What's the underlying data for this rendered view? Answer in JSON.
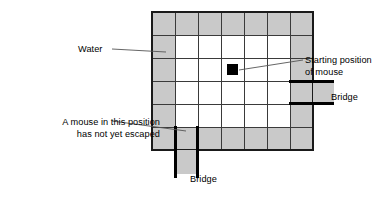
{
  "diagram": {
    "type": "grid-maze",
    "grid": {
      "rows": 7,
      "cols": 7,
      "cell_size_px": 23,
      "origin_x_px": 152,
      "origin_y_px": 12,
      "water_color": "#c9c9c9",
      "land_color": "#ffffff",
      "line_color": "#3a3a3a",
      "outer_line_color": "#1a1a1a",
      "bridge_color": "#000000",
      "mouse_color": "#000000",
      "water_ring_cells": "all perimeter cells of the 7x7 grid",
      "interior_cells": "5x5 white block, rows 2-6, cols 2-6",
      "mouse_start_cell": {
        "row": 3,
        "col": 4
      }
    },
    "bridges": [
      {
        "id": "bridge-right",
        "position": "right edge, row 4",
        "orientation": "horizontal",
        "extends_px": 36
      },
      {
        "id": "bridge-bottom",
        "position": "bottom edge, col 2",
        "orientation": "vertical",
        "extends_px": 28
      }
    ]
  },
  "labels": {
    "water": "Water",
    "starting_position_line1": "Starting position",
    "starting_position_line2": "of mouse",
    "bridge_right": "Bridge",
    "not_escaped_line1": "A mouse in this position",
    "not_escaped_line2": "has not yet escaped",
    "bridge_bottom": "Bridge"
  },
  "colors": {
    "water": "#c9c9c9",
    "land": "#ffffff",
    "grid_line": "#3a3a3a",
    "outer_border": "#1a1a1a",
    "bridge": "#000000",
    "mouse_marker": "#000000",
    "leader_line": "#555555",
    "text": "#000000",
    "background": "#ffffff"
  }
}
